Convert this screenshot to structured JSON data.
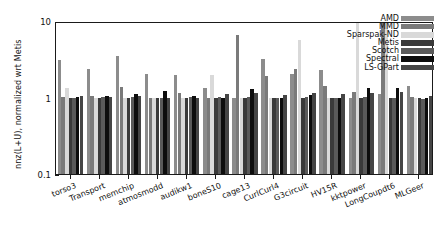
{
  "chart_data": {
    "type": "bar",
    "title": "",
    "xlabel": "",
    "ylabel": "nnz(L+U), normalized wrt Metis",
    "yscale": "log",
    "ylim": [
      0.1,
      10
    ],
    "ytick_labels": [
      "10",
      "1",
      "0.1"
    ],
    "ytick_values": [
      10,
      1,
      0.1
    ],
    "grid": false,
    "legend_position": "upper right",
    "categories": [
      "torso3",
      "Transport",
      "memchip",
      "atmosmodd",
      "audikw1",
      "boneS10",
      "cage13",
      "CurlCurl4",
      "G3circuit",
      "HV15R",
      "kktpower",
      "LongCoupdt6",
      "MLGeer"
    ],
    "series": [
      {
        "name": "AMD",
        "color": "#8c8c8c",
        "values": [
          3.05,
          2.35,
          3.45,
          2.05,
          1.95,
          1.35,
          1.0,
          3.2,
          2.05,
          2.3,
          1.0,
          1.12,
          1.4
        ]
      },
      {
        "name": "MMD",
        "color": "#7a7a7a",
        "values": [
          1.02,
          1.05,
          1.38,
          1.0,
          1.13,
          1.0,
          6.55,
          1.9,
          2.35,
          1.4,
          1.18,
          9.8,
          1.02
        ]
      },
      {
        "name": "Sparspak-ND",
        "color": "#d9d9d9",
        "values": [
          1.33,
          1.0,
          1.0,
          1.0,
          1.0,
          1.95,
          1.0,
          1.0,
          5.7,
          1.0,
          9.6,
          9.6,
          1.0
        ]
      },
      {
        "name": "Metis",
        "color": "#3a3a3a",
        "values": [
          1.0,
          1.0,
          1.0,
          1.0,
          1.0,
          1.0,
          1.0,
          1.0,
          1.0,
          1.0,
          1.0,
          1.0,
          1.0
        ]
      },
      {
        "name": "Scotch",
        "color": "#5a5a5a",
        "values": [
          1.0,
          1.02,
          1.02,
          1.0,
          1.02,
          1.02,
          1.03,
          1.0,
          1.02,
          1.0,
          1.02,
          1.0,
          0.95
        ]
      },
      {
        "name": "Spectral",
        "color": "#0d0d0d",
        "values": [
          1.03,
          1.04,
          1.1,
          1.2,
          1.05,
          1.0,
          1.3,
          1.0,
          1.08,
          1.0,
          1.33,
          1.35,
          1.0
        ]
      },
      {
        "name": "LS-GPart",
        "color": "#454545",
        "values": [
          1.06,
          1.03,
          1.06,
          1.0,
          1.0,
          1.1,
          1.13,
          1.08,
          1.13,
          1.1,
          1.13,
          1.18,
          1.05
        ]
      }
    ]
  },
  "legend": {
    "items": [
      {
        "label": "AMD"
      },
      {
        "label": "MMD"
      },
      {
        "label": "Sparspak-ND"
      },
      {
        "label": "Metis"
      },
      {
        "label": "Scotch"
      },
      {
        "label": "Spectral"
      },
      {
        "label": "LS-GPart"
      }
    ]
  }
}
